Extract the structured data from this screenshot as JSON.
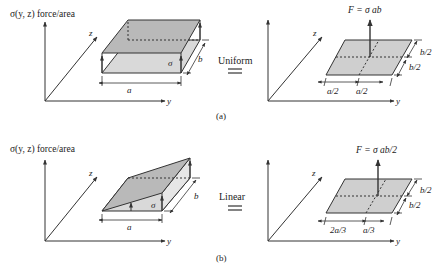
{
  "figure": {
    "panels": [
      {
        "id": "a",
        "caption": "(a)",
        "left": {
          "axis_label": "σ(y, z) force/area",
          "axis_y": "y",
          "axis_z": "z",
          "stress_symbol": "σ",
          "dim_a": "a",
          "dim_b": "b"
        },
        "equivalence_label": "Uniform",
        "equals_symbol": "=",
        "right": {
          "force_label": "F = σ ab",
          "axis_y": "y",
          "axis_z": "z",
          "dim_a_left": "a/2",
          "dim_a_right": "a/2",
          "dim_b_top": "b/2",
          "dim_b_bottom": "b/2"
        }
      },
      {
        "id": "b",
        "caption": "(b)",
        "left": {
          "axis_label": "σ(y, z) force/area",
          "axis_y": "y",
          "axis_z": "z",
          "stress_symbol": "σ",
          "dim_a": "a",
          "dim_b": "b"
        },
        "equivalence_label": "Linear",
        "equals_symbol": "=",
        "right": {
          "force_label": "F = σ ab/2",
          "axis_y": "y",
          "axis_z": "z",
          "dim_a_left": "2a/3",
          "dim_a_right": "a/3",
          "dim_b_top": "b/2",
          "dim_b_bottom": "b/2"
        }
      }
    ],
    "colors": {
      "line": "#333333",
      "face_dark": "#b9b9b9",
      "face_light": "#d9d9d9",
      "plate": "#cfcfcf"
    }
  }
}
